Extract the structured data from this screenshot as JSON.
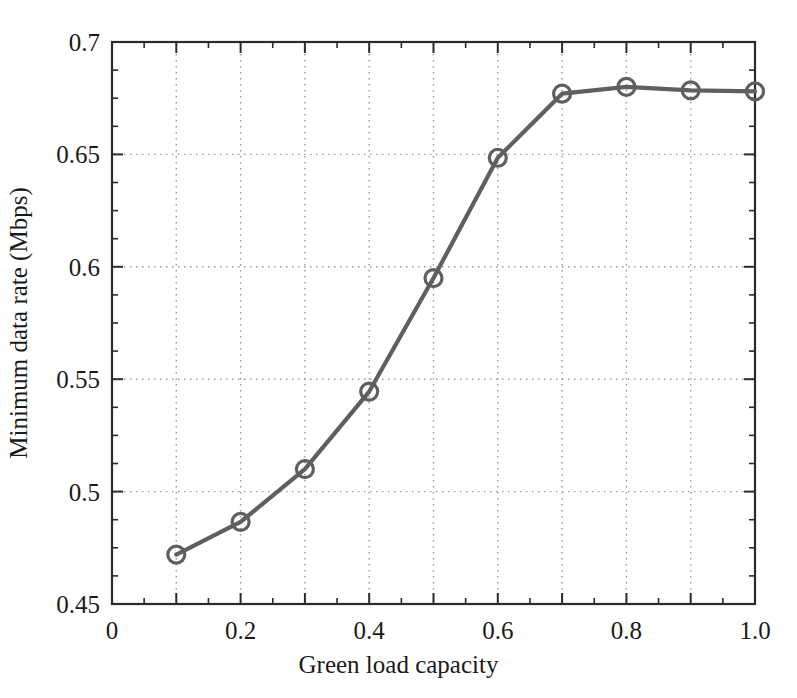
{
  "chart_data": {
    "type": "line",
    "title": "",
    "xlabel": "Green load capacity",
    "ylabel": "Minimum data rate (Mbps)",
    "x": [
      0.1,
      0.2,
      0.3,
      0.4,
      0.5,
      0.6,
      0.7,
      0.8,
      0.9,
      1.0
    ],
    "values": [
      0.472,
      0.4865,
      0.51,
      0.5445,
      0.595,
      0.6485,
      0.677,
      0.68,
      0.6785,
      0.678
    ],
    "series": [
      {
        "name": "Minimum data rate",
        "values": [
          0.472,
          0.4865,
          0.51,
          0.5445,
          0.595,
          0.6485,
          0.677,
          0.68,
          0.6785,
          0.678
        ]
      }
    ],
    "xlim": [
      0.0,
      1.0
    ],
    "ylim": [
      0.45,
      0.7
    ],
    "xticks": [
      0,
      0.2,
      0.4,
      0.6,
      0.8,
      1.0
    ],
    "xtick_labels": [
      "0",
      "0.2",
      "0.4",
      "0.6",
      "0.8",
      "1.0"
    ],
    "yticks": [
      0.45,
      0.5,
      0.55,
      0.6,
      0.65,
      0.7
    ],
    "ytick_labels": [
      "0.45",
      "0.5",
      "0.55",
      "0.6",
      "0.65",
      "0.7"
    ],
    "x_minor_step": 0.05,
    "y_minor_step": 0.0125,
    "grid": "dotted-both-axes",
    "legend": "none",
    "marker": "circle-open",
    "line_color": "#5f5f5f",
    "marker_color": "#5f5f5f",
    "grid_color": "#9a9a9a",
    "axis_color": "#2b2b2b",
    "background_color": "#ffffff"
  }
}
